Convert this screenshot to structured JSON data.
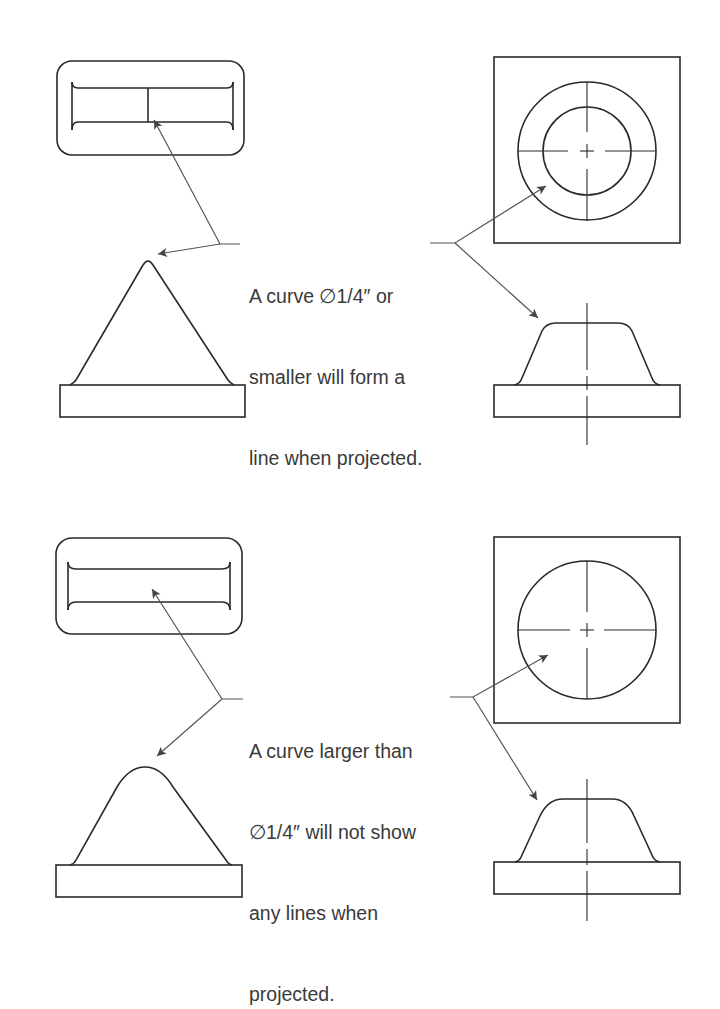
{
  "figure": {
    "panels": [
      {
        "id": "small-curve",
        "note_lines": [
          "A curve ∅1/4″ or",
          "smaller will form a",
          "line when projected."
        ],
        "shows_tangent_line": true
      },
      {
        "id": "large-curve",
        "note_lines": [
          "A curve larger than",
          "∅1/4″ will not show",
          "any lines when",
          "projected."
        ],
        "shows_tangent_line": false
      }
    ],
    "colors": {
      "line": "#2a2a2a",
      "leader": "#555555",
      "text": "#3a3a3a",
      "background": "#ffffff"
    }
  }
}
